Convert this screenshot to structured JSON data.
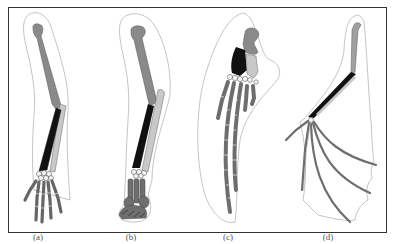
{
  "figure": {
    "panels": [
      {
        "id": "a",
        "label": "(a)"
      },
      {
        "id": "b",
        "label": "(b)"
      },
      {
        "id": "c",
        "label": "(c)"
      },
      {
        "id": "d",
        "label": "(d)"
      }
    ],
    "colors": {
      "frame": "#333333",
      "outline": "#999999",
      "humerus": "#8a8a8a",
      "radius": "#111111",
      "ulna": "#c8c8c8",
      "carpals": "#f4f4f4",
      "digits": "#6e6e6e",
      "background": "#ffffff"
    }
  }
}
